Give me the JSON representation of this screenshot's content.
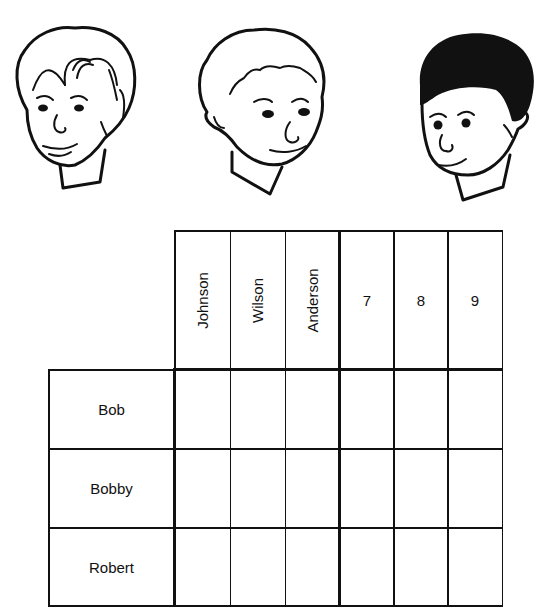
{
  "faces": [
    {
      "id": "boy-1",
      "hair": "light-wavy"
    },
    {
      "id": "boy-2",
      "hair": "curly"
    },
    {
      "id": "boy-3",
      "hair": "dark"
    }
  ],
  "grid": {
    "column_headers": [
      "Johnson",
      "Wilson",
      "Anderson",
      "7",
      "8",
      "9"
    ],
    "row_labels": [
      "Bob",
      "Bobby",
      "Robert"
    ],
    "cells": [
      [
        "",
        "",
        "",
        "",
        "",
        ""
      ],
      [
        "",
        "",
        "",
        "",
        "",
        ""
      ],
      [
        "",
        "",
        "",
        "",
        "",
        ""
      ]
    ]
  }
}
